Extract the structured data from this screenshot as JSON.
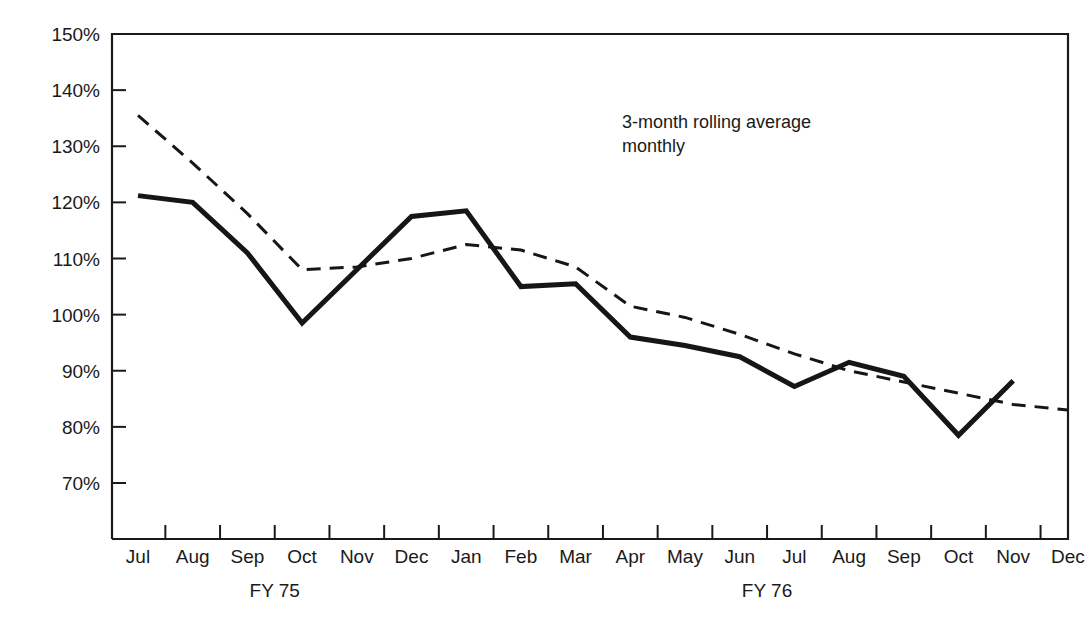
{
  "chart_data": {
    "type": "line",
    "title": "",
    "xlabel": "",
    "ylabel": "",
    "ylim": [
      65,
      150
    ],
    "yticks": [
      70,
      80,
      90,
      100,
      110,
      120,
      130,
      140,
      150
    ],
    "ytick_labels": [
      "70%",
      "80%",
      "90%",
      "100%",
      "110%",
      "120%",
      "130%",
      "140%",
      "150%"
    ],
    "grid": false,
    "legend_position": "annotation-inside-plot",
    "categories": [
      "Jul",
      "Aug",
      "Sep",
      "Oct",
      "Nov",
      "Dec",
      "Jan",
      "Feb",
      "Mar",
      "Apr",
      "May",
      "Jun",
      "Jul",
      "Aug",
      "Sep",
      "Oct",
      "Nov",
      "Dec"
    ],
    "fiscal_year_groups": [
      {
        "label": "FY 75",
        "start_index": 0,
        "end_index": 5
      },
      {
        "label": "FY 76",
        "start_index": 6,
        "end_index": 17
      }
    ],
    "annotations": [
      {
        "name": "series-annotation",
        "line1": "3-month rolling average",
        "line2": "monthly"
      }
    ],
    "series": [
      {
        "name": "monthly",
        "style": "solid",
        "values": [
          121.2,
          120.0,
          111.0,
          98.5,
          108.0,
          117.5,
          118.5,
          105.0,
          105.5,
          96.0,
          94.5,
          92.5,
          87.2,
          91.5,
          89.0,
          78.5,
          88.2,
          null
        ]
      },
      {
        "name": "3-month rolling average",
        "style": "dashed",
        "values": [
          135.5,
          127.0,
          118.0,
          108.0,
          108.5,
          110.0,
          112.5,
          111.5,
          108.5,
          101.5,
          99.5,
          96.5,
          93.0,
          90.0,
          88.0,
          86.0,
          84.0,
          83.0
        ]
      }
    ]
  },
  "plot_geometry": {
    "left": 112,
    "right": 1068,
    "top": 34,
    "bottom": 539,
    "y_value_at_top": 150,
    "pixels_per_percent": 5.6125,
    "first_tick_x": 138,
    "tick_spacing": 54.7
  },
  "colors": {
    "ink": "#1a1a1a",
    "series": "#161616",
    "background": "#ffffff"
  }
}
